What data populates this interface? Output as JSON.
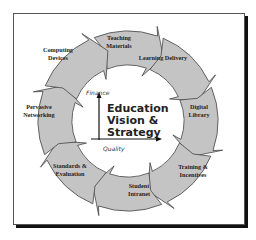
{
  "diagram": {
    "title_lines": [
      "Education",
      "Vision &",
      "Strategy"
    ],
    "axes": {
      "vertical_label": "Finance",
      "horizontal_label": "Quality"
    },
    "cycle_direction": "clockwise",
    "segments": [
      {
        "id": "teaching-materials",
        "lines": [
          "Teaching",
          "Materials"
        ]
      },
      {
        "id": "learning-delivery",
        "lines": [
          "Learning Delivery"
        ]
      },
      {
        "id": "digital-library",
        "lines": [
          "Digital",
          "Library"
        ]
      },
      {
        "id": "training-incentives",
        "lines": [
          "Training &",
          "Incentives"
        ]
      },
      {
        "id": "student-intranet",
        "lines": [
          "Student",
          "Intranet"
        ]
      },
      {
        "id": "standards-evaluation",
        "lines": [
          "Standards &",
          "Evaluation"
        ]
      },
      {
        "id": "pervasive-networking",
        "lines": [
          "Pervasive",
          "Networking"
        ]
      },
      {
        "id": "computing-devices",
        "lines": [
          "Computing",
          "Devices"
        ]
      }
    ],
    "colors": {
      "arrow_fill": "#c4c4c4",
      "arrow_stroke": "#444444",
      "frame_shadow": "#111111",
      "text": "#222222"
    }
  }
}
